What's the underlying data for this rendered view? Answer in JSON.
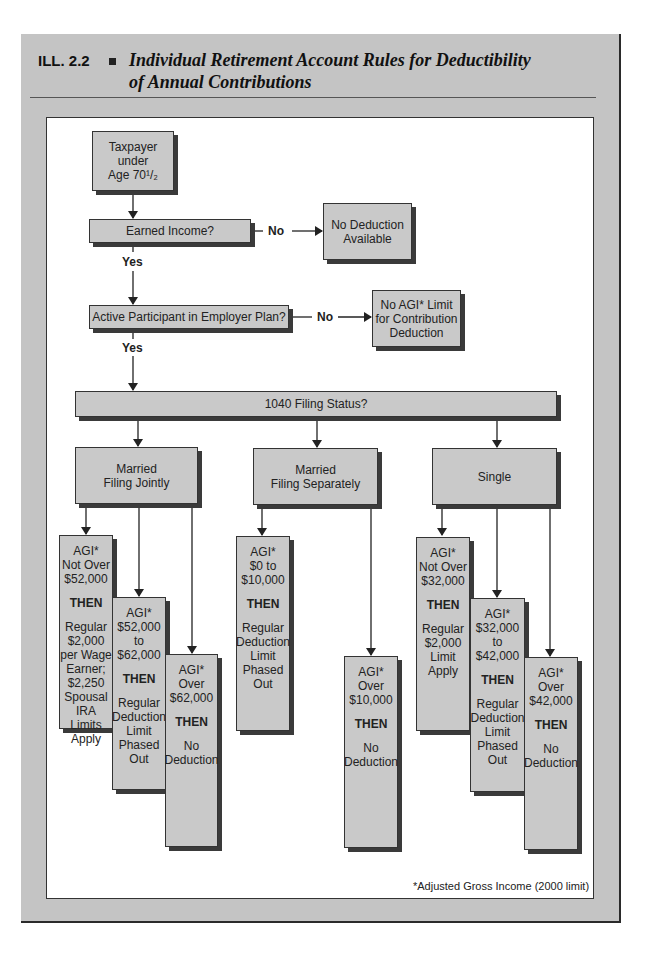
{
  "header": {
    "label": "ILL. 2.2",
    "title_line1": "Individual Retirement Account Rules for Deductibility",
    "title_line2": "of Annual Contributions"
  },
  "flowchart": {
    "start": {
      "line1": "Taxpayer",
      "line2": "under",
      "line3": "Age 70¹/₂"
    },
    "q_earned_income": {
      "label": "Earned Income?",
      "no_label": "No",
      "yes_label": "Yes"
    },
    "no_deduction_available": {
      "line1": "No Deduction",
      "line2": "Available"
    },
    "q_active_participant": {
      "label": "Active Participant in Employer Plan?",
      "no_label": "No",
      "yes_label": "Yes"
    },
    "no_agi_limit": {
      "line1": "No AGI* Limit",
      "line2": "for Contribution",
      "line3": "Deduction"
    },
    "q_filing_status": {
      "label": "1040 Filing Status?"
    },
    "statuses": [
      {
        "name_line1": "Married",
        "name_line2": "Filing Jointly",
        "outcomes": [
          {
            "range": [
              "AGI*",
              "Not Over",
              "$52,000"
            ],
            "then": "THEN",
            "result": [
              "Regular",
              "$2,000",
              "per Wage",
              "Earner;",
              "$2,250",
              "Spousal",
              "IRA",
              "Limits",
              "Apply"
            ]
          },
          {
            "range": [
              "AGI*",
              "$52,000",
              "to",
              "$62,000"
            ],
            "then": "THEN",
            "result": [
              "Regular",
              "Deduction",
              "Limit",
              "Phased",
              "Out"
            ]
          },
          {
            "range": [
              "AGI*",
              "Over",
              "$62,000"
            ],
            "then": "THEN",
            "result": [
              "No",
              "Deduction"
            ]
          }
        ]
      },
      {
        "name_line1": "Married",
        "name_line2": "Filing Separately",
        "outcomes": [
          {
            "range": [
              "AGI*",
              "$0 to",
              "$10,000"
            ],
            "then": "THEN",
            "result": [
              "Regular",
              "Deduction",
              "Limit",
              "Phased",
              "Out"
            ]
          },
          {
            "range": [
              "AGI*",
              "Over",
              "$10,000"
            ],
            "then": "THEN",
            "result": [
              "No",
              "Deduction"
            ]
          }
        ]
      },
      {
        "name_line1": "Single",
        "name_line2": "",
        "outcomes": [
          {
            "range": [
              "AGI*",
              "Not Over",
              "$32,000"
            ],
            "then": "THEN",
            "result": [
              "Regular",
              "$2,000",
              "Limit",
              "Apply"
            ]
          },
          {
            "range": [
              "AGI*",
              "$32,000",
              "to",
              "$42,000"
            ],
            "then": "THEN",
            "result": [
              "Regular",
              "Deduction",
              "Limit",
              "Phased",
              "Out"
            ]
          },
          {
            "range": [
              "AGI*",
              "Over",
              "$42,000"
            ],
            "then": "THEN",
            "result": [
              "No",
              "Deduction"
            ]
          }
        ]
      }
    ]
  },
  "footnote": "*Adjusted Gross Income (2000 limit)",
  "colors": {
    "frame": "#c4c4c4",
    "box": "#c9c9c9",
    "shadow": "#3a3a3a",
    "line": "#333333"
  }
}
